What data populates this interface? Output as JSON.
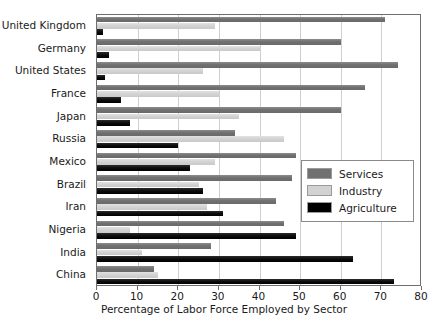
{
  "chart_data": {
    "type": "bar",
    "orientation": "horizontal",
    "title": "",
    "xlabel": "Percentage of Labor Force Employed by Sector",
    "ylabel": "",
    "xlim": [
      0,
      80
    ],
    "xticks": [
      0,
      10,
      20,
      30,
      40,
      50,
      60,
      70,
      80
    ],
    "grid": true,
    "legend_position": "center-right",
    "categories": [
      "United Kingdom",
      "Germany",
      "United States",
      "France",
      "Japan",
      "Russia",
      "Mexico",
      "Brazil",
      "Iran",
      "Nigeria",
      "India",
      "China"
    ],
    "series": [
      {
        "name": "Services",
        "color": "#707070",
        "values": [
          71,
          60,
          74,
          66,
          60,
          34,
          49,
          48,
          44,
          46,
          28,
          14
        ]
      },
      {
        "name": "Industry",
        "color": "#d2d2d2",
        "values": [
          29,
          40,
          26,
          30,
          35,
          46,
          29,
          25,
          27,
          8,
          11,
          15
        ]
      },
      {
        "name": "Agriculture",
        "color": "#000000",
        "values": [
          1.5,
          3,
          2,
          6,
          8,
          20,
          23,
          26,
          31,
          49,
          63,
          73
        ]
      }
    ]
  },
  "legend": {
    "entries": [
      {
        "label": "Services"
      },
      {
        "label": "Industry"
      },
      {
        "label": "Agriculture"
      }
    ]
  }
}
